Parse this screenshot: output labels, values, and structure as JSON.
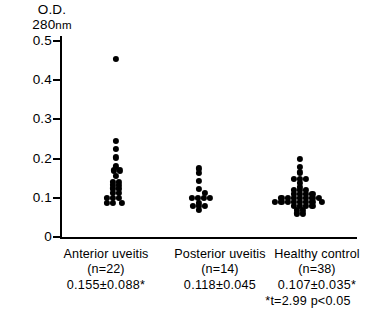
{
  "axis_title": {
    "line1": "O.D.",
    "line2_value": "280",
    "line2_unit": "nm"
  },
  "y_axis": {
    "ticks": [
      "0.5",
      "0.4",
      "0.3",
      "0.2",
      "0.1",
      "0"
    ]
  },
  "groups": [
    {
      "name": "Anterior uveitis",
      "n_label": "(n=22)",
      "stat_label": "0.155±0.088*"
    },
    {
      "name": "Posterior uveitis",
      "n_label": "(n=14)",
      "stat_label": "0.118±0.045"
    },
    {
      "name": "Healthy control",
      "n_label": "(n=38)",
      "stat_label": "0.107±0.035*"
    }
  ],
  "footnote": "*t=2.99 p<0.05",
  "colors": {
    "dot": "#000000",
    "axis": "#000000",
    "background": "#ffffff"
  },
  "chart_data": {
    "type": "scatter",
    "title": "",
    "xlabel": "",
    "ylabel": "O.D. 280nm",
    "ylim": [
      0,
      0.53
    ],
    "ytick_values": [
      0.5,
      0.4,
      0.3,
      0.2,
      0.1,
      0
    ],
    "grid": false,
    "legend": "none",
    "categories": [
      "Anterior uveitis",
      "Posterior uveitis",
      "Healthy control"
    ],
    "summary": [
      {
        "group": "Anterior uveitis",
        "n": 22,
        "mean": 0.155,
        "sd": 0.088,
        "significant": true
      },
      {
        "group": "Posterior uveitis",
        "n": 14,
        "mean": 0.118,
        "sd": 0.045,
        "significant": false
      },
      {
        "group": "Healthy control",
        "n": 38,
        "mean": 0.107,
        "sd": 0.035,
        "significant": true
      }
    ],
    "statistic": {
      "t": 2.99,
      "p": "<0.05"
    },
    "series": [
      {
        "name": "Anterior uveitis",
        "n": 22,
        "points": [
          {
            "value": 0.455,
            "jitter": 0
          },
          {
            "value": 0.245,
            "jitter": 0
          },
          {
            "value": 0.225,
            "jitter": 0
          },
          {
            "value": 0.203,
            "jitter": 0
          },
          {
            "value": 0.18,
            "jitter": 0
          },
          {
            "value": 0.17,
            "jitter": -0.4
          },
          {
            "value": 0.17,
            "jitter": 0.6
          },
          {
            "value": 0.155,
            "jitter": 0
          },
          {
            "value": 0.14,
            "jitter": -0.5
          },
          {
            "value": 0.14,
            "jitter": 0.5
          },
          {
            "value": 0.132,
            "jitter": -0.5
          },
          {
            "value": 0.132,
            "jitter": 0.5
          },
          {
            "value": 0.124,
            "jitter": -0.5
          },
          {
            "value": 0.124,
            "jitter": 0.5
          },
          {
            "value": 0.112,
            "jitter": -0.5
          },
          {
            "value": 0.112,
            "jitter": 0.5
          },
          {
            "value": 0.1,
            "jitter": -1.5
          },
          {
            "value": 0.1,
            "jitter": -0.5
          },
          {
            "value": 0.1,
            "jitter": 0.5
          },
          {
            "value": 0.088,
            "jitter": -1.5
          },
          {
            "value": 0.088,
            "jitter": -0.5
          },
          {
            "value": 0.088,
            "jitter": 0.9
          }
        ]
      },
      {
        "name": "Posterior uveitis",
        "n": 14,
        "points": [
          {
            "value": 0.175,
            "jitter": 0
          },
          {
            "value": 0.163,
            "jitter": 0
          },
          {
            "value": 0.143,
            "jitter": 0
          },
          {
            "value": 0.122,
            "jitter": 0
          },
          {
            "value": 0.113,
            "jitter": 0.9
          },
          {
            "value": 0.1,
            "jitter": -1.2
          },
          {
            "value": 0.1,
            "jitter": -0.2
          },
          {
            "value": 0.1,
            "jitter": 0.8
          },
          {
            "value": 0.1,
            "jitter": 1.8
          },
          {
            "value": 0.088,
            "jitter": 0
          },
          {
            "value": 0.08,
            "jitter": -1.0
          },
          {
            "value": 0.08,
            "jitter": 0
          },
          {
            "value": 0.08,
            "jitter": 1.0
          },
          {
            "value": 0.07,
            "jitter": 0
          }
        ]
      },
      {
        "name": "Healthy control",
        "n": 38,
        "points": [
          {
            "value": 0.2,
            "jitter": 0
          },
          {
            "value": 0.178,
            "jitter": 0
          },
          {
            "value": 0.165,
            "jitter": 0
          },
          {
            "value": 0.148,
            "jitter": -1.0
          },
          {
            "value": 0.148,
            "jitter": 0
          },
          {
            "value": 0.148,
            "jitter": 1.0
          },
          {
            "value": 0.138,
            "jitter": 0
          },
          {
            "value": 0.128,
            "jitter": 0
          },
          {
            "value": 0.12,
            "jitter": -1.0
          },
          {
            "value": 0.12,
            "jitter": 0
          },
          {
            "value": 0.12,
            "jitter": 1.0
          },
          {
            "value": 0.11,
            "jitter": -1.0
          },
          {
            "value": 0.11,
            "jitter": 0
          },
          {
            "value": 0.11,
            "jitter": 1.0
          },
          {
            "value": 0.11,
            "jitter": 2.0
          },
          {
            "value": 0.1,
            "jitter": -3.0
          },
          {
            "value": 0.1,
            "jitter": -2.0
          },
          {
            "value": 0.1,
            "jitter": -1.0
          },
          {
            "value": 0.1,
            "jitter": 0
          },
          {
            "value": 0.1,
            "jitter": 1.0
          },
          {
            "value": 0.1,
            "jitter": 2.0
          },
          {
            "value": 0.1,
            "jitter": 3.0
          },
          {
            "value": 0.09,
            "jitter": -4.0
          },
          {
            "value": 0.09,
            "jitter": -3.0
          },
          {
            "value": 0.09,
            "jitter": -2.0
          },
          {
            "value": 0.09,
            "jitter": -1.0
          },
          {
            "value": 0.09,
            "jitter": 0
          },
          {
            "value": 0.09,
            "jitter": 1.0
          },
          {
            "value": 0.09,
            "jitter": 2.0
          },
          {
            "value": 0.09,
            "jitter": 3.5
          },
          {
            "value": 0.08,
            "jitter": -1.0
          },
          {
            "value": 0.08,
            "jitter": 0
          },
          {
            "value": 0.08,
            "jitter": 1.0
          },
          {
            "value": 0.08,
            "jitter": 2.0
          },
          {
            "value": 0.07,
            "jitter": -0.5
          },
          {
            "value": 0.07,
            "jitter": 0.5
          },
          {
            "value": 0.06,
            "jitter": -0.5
          },
          {
            "value": 0.06,
            "jitter": 0.5
          }
        ]
      }
    ]
  }
}
